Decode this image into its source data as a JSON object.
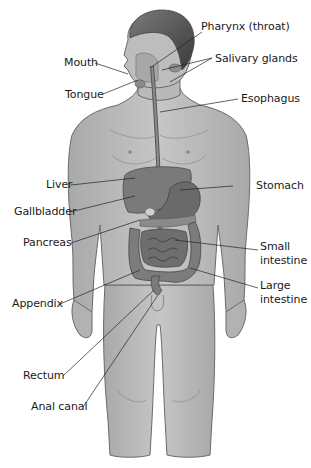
{
  "diagram": {
    "labels": {
      "pharynx": "Pharynx (throat)",
      "salivary": "Salivary glands",
      "mouth": "Mouth",
      "tongue": "Tongue",
      "esophagus": "Esophagus",
      "liver": "Liver",
      "stomach": "Stomach",
      "gallbladder": "Gallbladder",
      "pancreas": "Pancreas",
      "small_intestine_1": "Small",
      "small_intestine_2": "intestine",
      "large_intestine_1": "Large",
      "large_intestine_2": "intestine",
      "appendix": "Appendix",
      "rectum": "Rectum",
      "anal_canal": "Anal canal"
    },
    "colors": {
      "skin": "#bdbdbd",
      "skin_shadow": "#9e9e9e",
      "outline": "#6a6a6a",
      "hair": "#4a4a4a",
      "organ_dark": "#6e6e6e",
      "organ_mid": "#8a8a8a",
      "leader_line": "#222222",
      "text": "#1a1a1a"
    }
  }
}
